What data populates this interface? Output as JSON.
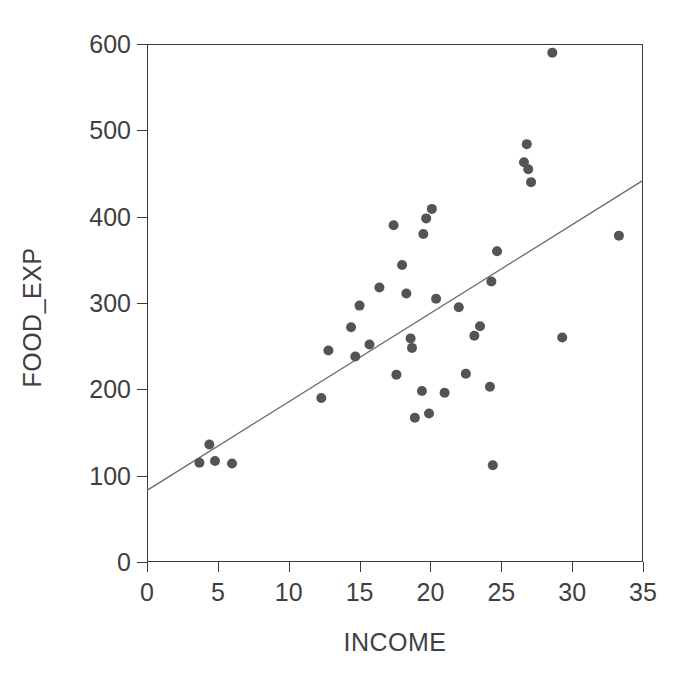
{
  "chart_data": {
    "type": "scatter",
    "title": "",
    "xlabel": "INCOME",
    "ylabel": "FOOD_EXP",
    "xlim": [
      0,
      35
    ],
    "ylim": [
      0,
      600
    ],
    "xticks": [
      0,
      5,
      10,
      15,
      20,
      25,
      30,
      35
    ],
    "yticks": [
      0,
      100,
      200,
      300,
      400,
      500,
      600
    ],
    "grid": false,
    "legend": null,
    "marker": {
      "shape": "circle",
      "color": "#545454",
      "size": 6
    },
    "points": [
      {
        "x": 3.7,
        "y": 115
      },
      {
        "x": 4.4,
        "y": 136
      },
      {
        "x": 4.8,
        "y": 117
      },
      {
        "x": 6.0,
        "y": 114
      },
      {
        "x": 12.3,
        "y": 190
      },
      {
        "x": 12.8,
        "y": 245
      },
      {
        "x": 14.4,
        "y": 272
      },
      {
        "x": 14.7,
        "y": 238
      },
      {
        "x": 15.0,
        "y": 297
      },
      {
        "x": 15.7,
        "y": 252
      },
      {
        "x": 16.4,
        "y": 318
      },
      {
        "x": 17.4,
        "y": 390
      },
      {
        "x": 17.6,
        "y": 217
      },
      {
        "x": 18.0,
        "y": 344
      },
      {
        "x": 18.3,
        "y": 311
      },
      {
        "x": 18.6,
        "y": 259
      },
      {
        "x": 18.7,
        "y": 248
      },
      {
        "x": 18.9,
        "y": 167
      },
      {
        "x": 19.4,
        "y": 198
      },
      {
        "x": 19.5,
        "y": 380
      },
      {
        "x": 19.7,
        "y": 398
      },
      {
        "x": 19.9,
        "y": 172
      },
      {
        "x": 20.1,
        "y": 409
      },
      {
        "x": 20.4,
        "y": 305
      },
      {
        "x": 21.0,
        "y": 196
      },
      {
        "x": 22.0,
        "y": 295
      },
      {
        "x": 22.5,
        "y": 218
      },
      {
        "x": 23.1,
        "y": 262
      },
      {
        "x": 23.5,
        "y": 273
      },
      {
        "x": 24.2,
        "y": 203
      },
      {
        "x": 24.3,
        "y": 325
      },
      {
        "x": 24.4,
        "y": 112
      },
      {
        "x": 24.7,
        "y": 360
      },
      {
        "x": 26.6,
        "y": 463
      },
      {
        "x": 26.8,
        "y": 484
      },
      {
        "x": 26.9,
        "y": 455
      },
      {
        "x": 27.1,
        "y": 440
      },
      {
        "x": 28.6,
        "y": 590
      },
      {
        "x": 29.3,
        "y": 260
      },
      {
        "x": 33.3,
        "y": 378
      }
    ],
    "fit_line": {
      "name": "linear-fit",
      "x0": 0,
      "y0": 83,
      "x1": 35,
      "y1": 442,
      "color": "#6b6b6b"
    }
  }
}
